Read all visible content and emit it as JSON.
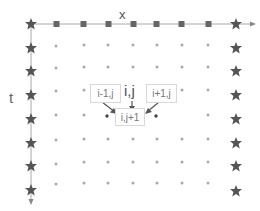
{
  "diagram": {
    "axis_x_label": "x",
    "axis_t_label": "t",
    "stencil": {
      "left_label": "i-1,j",
      "center_label": "i,j",
      "right_label": "i+1,j",
      "target_label": "i,j+1"
    },
    "colors": {
      "axis": "#aaaaaa",
      "star": "#555555",
      "square": "#666666",
      "dot": "#aaaaaa",
      "dark_dot": "#444444",
      "arrow": "#555555"
    },
    "grid": {
      "columns_x": [
        31,
        57,
        83,
        108,
        134,
        160,
        186,
        212,
        236
      ],
      "rows_y": [
        24,
        48,
        71,
        95,
        119,
        143,
        166,
        190
      ]
    }
  }
}
